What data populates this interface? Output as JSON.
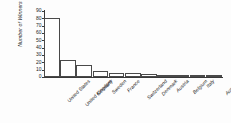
{
  "chart_data": {
    "type": "bar",
    "title": "",
    "xlabel": "",
    "ylabel": "Number of Winners",
    "ylim": [
      0,
      90
    ],
    "yticks": [
      0,
      10,
      20,
      30,
      40,
      50,
      60,
      70,
      80,
      90
    ],
    "grid": false,
    "legend": null,
    "bar_facecolor": "#ffffff",
    "bar_edgecolor": "#4a4a4a",
    "categories": [
      "United States",
      "United Kingdom",
      "Germany",
      "Sweden",
      "France",
      "Switzerland",
      "Denmark",
      "Austria",
      "Belgium",
      "Italy",
      "Australia"
    ],
    "values": [
      80,
      23,
      17,
      8,
      6,
      5,
      4,
      3,
      3,
      2,
      2
    ]
  }
}
